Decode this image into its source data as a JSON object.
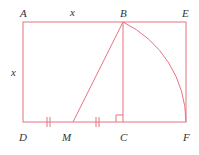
{
  "diagram": {
    "stroke_color": "#e8737f",
    "label_color": "#333333",
    "points": {
      "A": {
        "label": "A",
        "x": 23,
        "y": 22
      },
      "B": {
        "label": "B",
        "x": 123,
        "y": 22
      },
      "E": {
        "label": "E",
        "x": 186,
        "y": 22
      },
      "D": {
        "label": "D",
        "x": 23,
        "y": 122
      },
      "M": {
        "label": "M",
        "x": 73,
        "y": 122
      },
      "C": {
        "label": "C",
        "x": 123,
        "y": 122
      },
      "F": {
        "label": "F",
        "x": 186,
        "y": 122
      }
    },
    "side_labels": {
      "top": "x",
      "left": "x"
    }
  }
}
